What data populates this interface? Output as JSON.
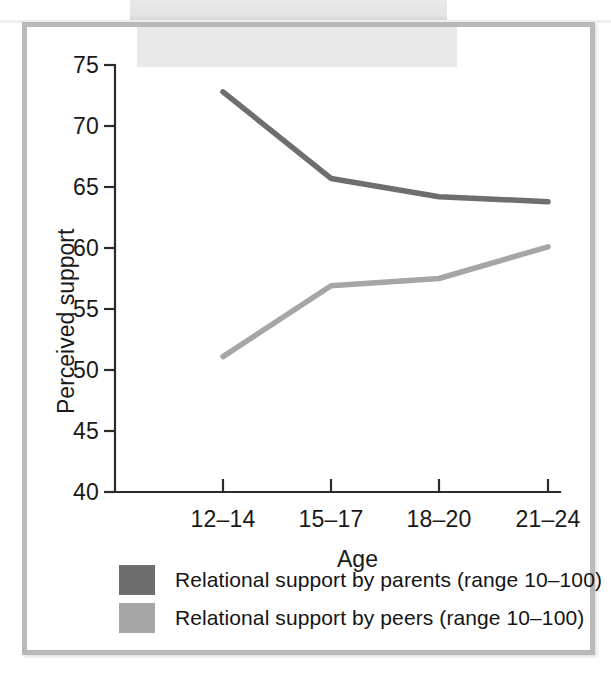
{
  "figure": {
    "background_color": "#ffffff",
    "frame_color": "#b9b9b9"
  },
  "chart_data": {
    "type": "line",
    "title": "",
    "subtitle": "",
    "xlabel": "Age",
    "ylabel": "Perceived support",
    "categories": [
      "12–14",
      "15–17",
      "18–20",
      "21–24"
    ],
    "ylim": [
      40,
      75
    ],
    "yticks": [
      40,
      45,
      50,
      55,
      60,
      65,
      70,
      75
    ],
    "ytick_labels": [
      "40",
      "45",
      "50",
      "55",
      "60",
      "65",
      "70",
      "75"
    ],
    "grid": false,
    "legend_position": "below-axis",
    "series": [
      {
        "name": "Relational support by parents (range 10–100)",
        "color": "#6e6e6e",
        "values": [
          72.8,
          65.7,
          64.2,
          63.8
        ]
      },
      {
        "name": "Relational support by peers (range 10–100)",
        "color": "#a6a6a6",
        "values": [
          51.1,
          56.9,
          57.5,
          60.1
        ]
      }
    ]
  },
  "legend": {
    "items": [
      {
        "label": "Relational support by parents (range 10–100)",
        "color": "#6e6e6e"
      },
      {
        "label": "Relational support by peers (range 10–100)",
        "color": "#a6a6a6"
      }
    ]
  }
}
